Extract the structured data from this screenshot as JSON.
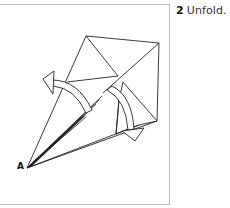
{
  "step": {
    "number": "2",
    "instruction": "Unfold."
  },
  "diagram": {
    "point_label": "A",
    "line_color": "#222222",
    "paper_color": "#ffffff",
    "frame_color": "#b9b9b9",
    "arrows": [
      {
        "name": "unfold-arrow-left",
        "direction": "up-left"
      },
      {
        "name": "unfold-arrow-right",
        "direction": "down-right"
      }
    ]
  }
}
